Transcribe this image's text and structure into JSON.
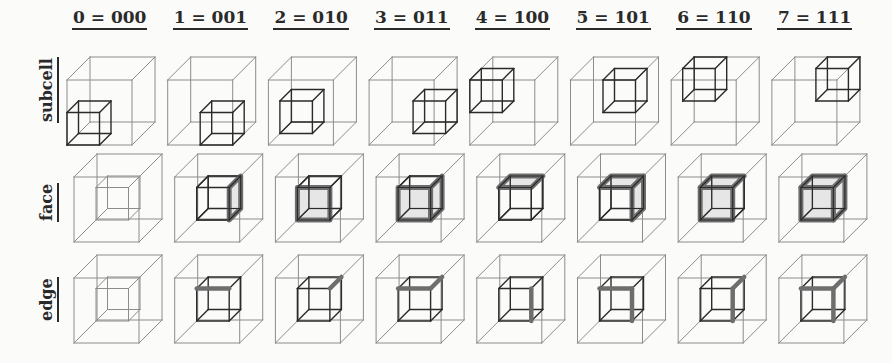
{
  "figure": {
    "columns": [
      {
        "index": 0,
        "label": "0 = 000",
        "bits": "000"
      },
      {
        "index": 1,
        "label": "1 = 001",
        "bits": "001"
      },
      {
        "index": 2,
        "label": "2 = 010",
        "bits": "010"
      },
      {
        "index": 3,
        "label": "3 = 011",
        "bits": "011"
      },
      {
        "index": 4,
        "label": "4 = 100",
        "bits": "100"
      },
      {
        "index": 5,
        "label": "5 = 101",
        "bits": "101"
      },
      {
        "index": 6,
        "label": "6 = 110",
        "bits": "110"
      },
      {
        "index": 7,
        "label": "7 = 111",
        "bits": "111"
      }
    ],
    "rows": [
      {
        "key": "subcell",
        "label": "subcell"
      },
      {
        "key": "face",
        "label": "face"
      },
      {
        "key": "edge",
        "label": "edge"
      }
    ],
    "subcell_positions": [
      {
        "x": 0,
        "y": 0,
        "z": 0
      },
      {
        "x": 1,
        "y": 0,
        "z": 0
      },
      {
        "x": 0,
        "y": 0,
        "z": 1
      },
      {
        "x": 1,
        "y": 0,
        "z": 1
      },
      {
        "x": 0,
        "y": 1,
        "z": 0
      },
      {
        "x": 1,
        "y": 1,
        "z": 0
      },
      {
        "x": 0,
        "y": 1,
        "z": 1
      },
      {
        "x": 1,
        "y": 1,
        "z": 1
      }
    ],
    "face_highlights": [
      [],
      [
        "right"
      ],
      [
        "front"
      ],
      [
        "front",
        "right"
      ],
      [
        "top"
      ],
      [
        "top",
        "right"
      ],
      [
        "front",
        "top"
      ],
      [
        "front",
        "top",
        "right"
      ]
    ],
    "edge_highlights": [
      [],
      [
        "top-front"
      ],
      [
        "top-right"
      ],
      [
        "top-front",
        "top-right"
      ],
      [
        "front-right"
      ],
      [
        "front-right",
        "top-front"
      ],
      [
        "front-right",
        "top-right"
      ],
      [
        "front-right",
        "top-front",
        "top-right"
      ]
    ],
    "colors": {
      "outer_line": "#8c8c8c",
      "inner_line": "#2b2b2b",
      "inner_line_light": "#8c8c8c",
      "highlight_stroke": "#6e6e6e",
      "highlight_fill": "#d9d9d9",
      "text": "#2a2a2a"
    }
  }
}
